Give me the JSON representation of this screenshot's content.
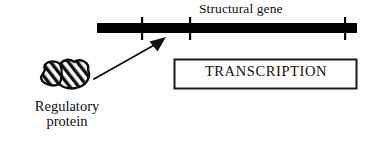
{
  "diagram": {
    "title_text": "Structural gene",
    "transcription_text": "TRANSCRIPTION",
    "protein_label_line1": "Regulatory",
    "protein_label_line2": "protein",
    "colors": {
      "ink": "#101010",
      "background": "#ffffff",
      "gene_bar": "#000000",
      "box_border": "#1a1a1a"
    },
    "gene_bar": {
      "x1": 97,
      "x2": 357,
      "y": 28,
      "thickness": 10,
      "tick_positions": [
        142,
        190,
        345
      ],
      "tick_top": 17,
      "tick_bottom": 40
    },
    "arrow": {
      "tail_x": 94,
      "tail_y": 79,
      "tip_x": 166,
      "tip_y": 38
    },
    "protein_blob": {
      "x": 38,
      "y": 62,
      "width": 52,
      "height": 27,
      "hatch": "diagonal-stripes"
    },
    "transcription_box": {
      "x": 174,
      "y": 59,
      "width": 183,
      "height": 30
    }
  }
}
